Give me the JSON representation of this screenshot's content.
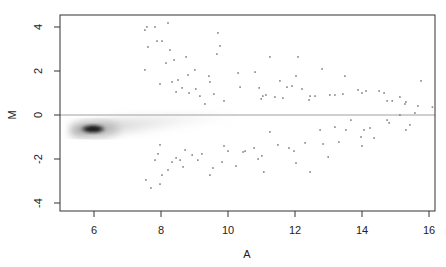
{
  "chart_data": {
    "type": "scatter",
    "title": "",
    "xlabel": "A",
    "ylabel": "M",
    "xlim": [
      4.97,
      16.2
    ],
    "ylim": [
      -4.4,
      4.5
    ],
    "xticks": [
      6,
      8,
      10,
      12,
      14,
      16
    ],
    "yticks": [
      4,
      2,
      0,
      -2,
      -4
    ],
    "grid": false,
    "legend": null,
    "reference_line": {
      "M": 0,
      "color": "#a0a0a0"
    },
    "density_cloud": {
      "description": "smoothed density of the bulk of points",
      "core_center": {
        "A": 5.9,
        "M": -0.6
      },
      "extends_to_A": 10.5,
      "color": "#000000"
    },
    "points_color": "#808080",
    "points": [
      {
        "A": 7.58,
        "M": 4.0
      },
      {
        "A": 7.52,
        "M": 3.86
      },
      {
        "A": 7.61,
        "M": 3.09
      },
      {
        "A": 7.52,
        "M": 2.05
      },
      {
        "A": 7.88,
        "M": 3.36
      },
      {
        "A": 8.03,
        "M": 3.36
      },
      {
        "A": 7.82,
        "M": 4.0
      },
      {
        "A": 8.21,
        "M": 4.18
      },
      {
        "A": 8.27,
        "M": 2.95
      },
      {
        "A": 8.15,
        "M": 2.36
      },
      {
        "A": 7.97,
        "M": 1.41
      },
      {
        "A": 8.33,
        "M": 1.5
      },
      {
        "A": 8.45,
        "M": 1.05
      },
      {
        "A": 8.51,
        "M": 1.59
      },
      {
        "A": 8.63,
        "M": 1.23
      },
      {
        "A": 8.39,
        "M": 2.5
      },
      {
        "A": 8.75,
        "M": 2.64
      },
      {
        "A": 8.81,
        "M": 1.82
      },
      {
        "A": 8.84,
        "M": 1.0
      },
      {
        "A": 9.01,
        "M": 2.05
      },
      {
        "A": 9.04,
        "M": 1.18
      },
      {
        "A": 9.16,
        "M": 0.86
      },
      {
        "A": 9.31,
        "M": 0.5
      },
      {
        "A": 9.43,
        "M": 1.77
      },
      {
        "A": 9.46,
        "M": 1.5
      },
      {
        "A": 9.58,
        "M": 0.95
      },
      {
        "A": 9.7,
        "M": 3.73
      },
      {
        "A": 9.67,
        "M": 2.77
      },
      {
        "A": 9.76,
        "M": 3.14
      },
      {
        "A": 9.88,
        "M": 0.64
      },
      {
        "A": 10.3,
        "M": 1.91
      },
      {
        "A": 10.36,
        "M": 1.27
      },
      {
        "A": 10.93,
        "M": 1.23
      },
      {
        "A": 10.81,
        "M": 1.95
      },
      {
        "A": 10.99,
        "M": 0.73
      },
      {
        "A": 11.13,
        "M": 0.91
      },
      {
        "A": 11.04,
        "M": 0.86
      },
      {
        "A": 11.25,
        "M": 2.64
      },
      {
        "A": 11.4,
        "M": 0.82
      },
      {
        "A": 11.55,
        "M": 1.55
      },
      {
        "A": 11.64,
        "M": 0.77
      },
      {
        "A": 11.76,
        "M": 1.27
      },
      {
        "A": 11.91,
        "M": 1.32
      },
      {
        "A": 12.03,
        "M": 1.77
      },
      {
        "A": 12.09,
        "M": 2.64
      },
      {
        "A": 12.21,
        "M": 1.18
      },
      {
        "A": 12.42,
        "M": 0.68
      },
      {
        "A": 12.45,
        "M": 0.86
      },
      {
        "A": 12.6,
        "M": 0.86
      },
      {
        "A": 12.81,
        "M": 2.09
      },
      {
        "A": 13.04,
        "M": 0.91
      },
      {
        "A": 13.19,
        "M": 0.91
      },
      {
        "A": 13.43,
        "M": 0.95
      },
      {
        "A": 13.49,
        "M": 1.77
      },
      {
        "A": 13.88,
        "M": 1.14
      },
      {
        "A": 14.0,
        "M": 1.0
      },
      {
        "A": 14.12,
        "M": 1.09
      },
      {
        "A": 14.51,
        "M": 1.09
      },
      {
        "A": 14.66,
        "M": 1.0
      },
      {
        "A": 14.75,
        "M": 0.64
      },
      {
        "A": 14.9,
        "M": 0.64
      },
      {
        "A": 15.13,
        "M": 0.82
      },
      {
        "A": 15.28,
        "M": 0.5
      },
      {
        "A": 15.31,
        "M": 0.59
      },
      {
        "A": 15.67,
        "M": 0.41
      },
      {
        "A": 15.76,
        "M": 1.55
      },
      {
        "A": 15.58,
        "M": 0.09
      },
      {
        "A": 16.1,
        "M": 0.36
      },
      {
        "A": 7.55,
        "M": -2.95
      },
      {
        "A": 7.7,
        "M": -3.32
      },
      {
        "A": 7.82,
        "M": -2.05
      },
      {
        "A": 7.91,
        "M": -1.77
      },
      {
        "A": 7.97,
        "M": -1.36
      },
      {
        "A": 8.03,
        "M": -2.73
      },
      {
        "A": 7.97,
        "M": -3.14
      },
      {
        "A": 8.21,
        "M": -2.5
      },
      {
        "A": 8.33,
        "M": -2.14
      },
      {
        "A": 8.45,
        "M": -1.95
      },
      {
        "A": 8.57,
        "M": -2.05
      },
      {
        "A": 8.66,
        "M": -2.36
      },
      {
        "A": 8.72,
        "M": -1.59
      },
      {
        "A": 8.93,
        "M": -1.82
      },
      {
        "A": 9.1,
        "M": -2.05
      },
      {
        "A": 9.22,
        "M": -1.77
      },
      {
        "A": 9.46,
        "M": -2.73
      },
      {
        "A": 9.55,
        "M": -2.41
      },
      {
        "A": 9.82,
        "M": -2.14
      },
      {
        "A": 9.88,
        "M": -1.41
      },
      {
        "A": 10.0,
        "M": -1.64
      },
      {
        "A": 10.24,
        "M": -2.32
      },
      {
        "A": 10.45,
        "M": -1.68
      },
      {
        "A": 10.51,
        "M": -1.64
      },
      {
        "A": 10.78,
        "M": -1.5
      },
      {
        "A": 10.9,
        "M": -2.0
      },
      {
        "A": 11.01,
        "M": -1.86
      },
      {
        "A": 11.07,
        "M": -2.59
      },
      {
        "A": 11.25,
        "M": -0.77
      },
      {
        "A": 11.49,
        "M": -1.36
      },
      {
        "A": 11.82,
        "M": -1.5
      },
      {
        "A": 11.97,
        "M": -1.64
      },
      {
        "A": 12.03,
        "M": -2.18
      },
      {
        "A": 12.3,
        "M": -1.27
      },
      {
        "A": 12.45,
        "M": -2.59
      },
      {
        "A": 12.75,
        "M": -0.68
      },
      {
        "A": 12.84,
        "M": -1.32
      },
      {
        "A": 12.99,
        "M": -1.91
      },
      {
        "A": 13.19,
        "M": -0.55
      },
      {
        "A": 13.31,
        "M": -1.23
      },
      {
        "A": 13.52,
        "M": -0.68
      },
      {
        "A": 13.67,
        "M": -0.23
      },
      {
        "A": 14.06,
        "M": -0.68
      },
      {
        "A": 13.97,
        "M": -1.0
      },
      {
        "A": 14.0,
        "M": -1.41
      },
      {
        "A": 14.24,
        "M": -0.59
      },
      {
        "A": 14.36,
        "M": -1.05
      },
      {
        "A": 14.75,
        "M": -0.23
      },
      {
        "A": 14.81,
        "M": -0.36
      },
      {
        "A": 15.13,
        "M": 0.0
      },
      {
        "A": 15.31,
        "M": -0.68
      },
      {
        "A": 15.43,
        "M": -0.45
      }
    ]
  }
}
